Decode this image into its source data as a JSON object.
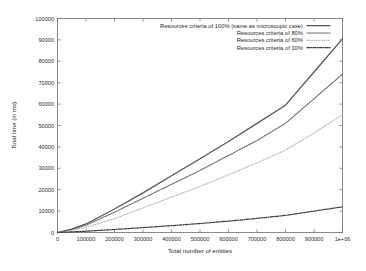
{
  "chart_data": {
    "type": "line",
    "title": "",
    "xlabel": "Total number of entities",
    "ylabel": "Total time (in ms)",
    "xlim": [
      0,
      1000000
    ],
    "ylim": [
      0,
      100000
    ],
    "grid": false,
    "legend_position": "top-right-inside",
    "xticks": [
      0,
      100000,
      200000,
      300000,
      400000,
      500000,
      600000,
      700000,
      800000,
      900000,
      1000000
    ],
    "xticklabels": [
      "0",
      "100000",
      "200000",
      "300000",
      "400000",
      "500000",
      "600000",
      "700000",
      "800000",
      "900000",
      "1e+06"
    ],
    "yticks": [
      0,
      10000,
      20000,
      30000,
      40000,
      50000,
      60000,
      70000,
      80000,
      90000,
      100000
    ],
    "yticklabels": [
      "0",
      "10000",
      "20000",
      "30000",
      "40000",
      "50000",
      "60000",
      "70000",
      "80000",
      "90000",
      "100000"
    ],
    "x": [
      0,
      50000,
      100000,
      200000,
      300000,
      400000,
      500000,
      600000,
      700000,
      800000,
      900000,
      1000000
    ],
    "series": [
      {
        "name": "Resources criteria of 100% (same as microscopic case)",
        "style": "solid",
        "color": "#555555",
        "values": [
          0,
          1600,
          4000,
          11000,
          18500,
          26500,
          34500,
          42500,
          51000,
          59500,
          75000,
          90500
        ]
      },
      {
        "name": "Resources criteria of 80%",
        "style": "dotted",
        "color": "#5a5a5a",
        "values": [
          0,
          1400,
          3400,
          9500,
          16000,
          22500,
          29000,
          36000,
          43000,
          51000,
          62500,
          74000
        ]
      },
      {
        "name": "Resources criteria of 60%",
        "style": "fine-dotted",
        "color": "#a9a9a9",
        "values": [
          0,
          1000,
          2400,
          6500,
          11500,
          16500,
          21500,
          27000,
          32500,
          38500,
          46500,
          55000
        ]
      },
      {
        "name": "Resources criteria of 10%",
        "style": "dashdot",
        "color": "#3a3a3a",
        "values": [
          0,
          300,
          600,
          1400,
          2300,
          3200,
          4200,
          5300,
          6600,
          8000,
          10000,
          12000
        ]
      }
    ]
  },
  "legend": {
    "entries": [
      {
        "label": "Resources criteria of 100% (same as microscopic case)",
        "style": "solid"
      },
      {
        "label": "Resources criteria of 80%",
        "style": "dotted"
      },
      {
        "label": "Resources criteria of 60%",
        "style": "fine-dotted"
      },
      {
        "label": "Resources criteria of 10%",
        "style": "dashdot"
      }
    ]
  }
}
